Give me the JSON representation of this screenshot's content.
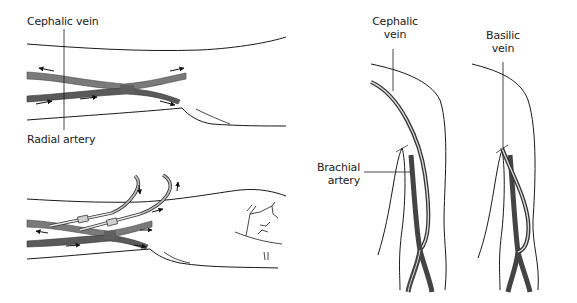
{
  "figure": {
    "panels": [
      {
        "id": "wrist-fistula",
        "description": "Radiocephalic arteriovenous fistula at the wrist with flow arrows",
        "labels": {
          "vein": "Cephalic vein",
          "artery": "Radial artery"
        }
      },
      {
        "id": "wrist-fistula-cannulated",
        "description": "Same fistula with two dialysis needles/cannulae inserted, flow arrows"
      },
      {
        "id": "elbow-cephalic",
        "description": "Brachiocephalic fistula at the elbow",
        "labels": {
          "vein_line1": "Cephalic",
          "vein_line2": "vein",
          "artery_line1": "Brachial",
          "artery_line2": "artery"
        }
      },
      {
        "id": "elbow-basilic",
        "description": "Brachiobasilic fistula at the elbow",
        "labels": {
          "vein_line1": "Basilic",
          "vein_line2": "vein"
        }
      }
    ],
    "colors": {
      "outline": "#1a1a1a",
      "vein_fill": "#7a7a7a",
      "artery_fill": "#555555",
      "vessel_edge": "#333333",
      "background": "#ffffff"
    }
  }
}
